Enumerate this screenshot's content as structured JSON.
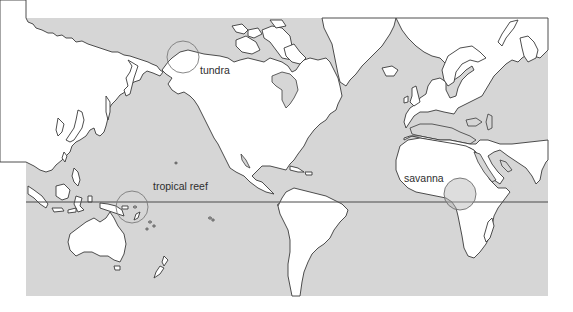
{
  "map": {
    "projection": "Pacific-centered world map",
    "colors": {
      "ocean": "#d6d6d6",
      "land": "#ffffff",
      "coastline": "#3a3a3a",
      "equator": "#4a4a4a",
      "zone_circle": "#6e6e6e"
    },
    "equator_line": {
      "label": ""
    },
    "biome_markers": [
      {
        "id": "tundra",
        "label": "tundra",
        "region": "Arctic coast, Alaska/Canada"
      },
      {
        "id": "tropical-reef",
        "label": "tropical reef",
        "region": "Western Pacific, near Solomon Islands"
      },
      {
        "id": "savanna",
        "label": "savanna",
        "region": "East Africa"
      }
    ]
  }
}
